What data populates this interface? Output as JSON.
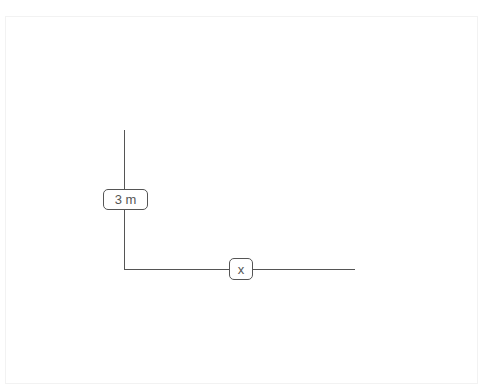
{
  "diagram": {
    "type": "right-angle-measurement",
    "vertical_side": {
      "label": "3 m"
    },
    "horizontal_side": {
      "label": "x"
    },
    "colors": {
      "line": "#555555",
      "background": "#ffffff",
      "frame": "#f2f2f2"
    }
  }
}
